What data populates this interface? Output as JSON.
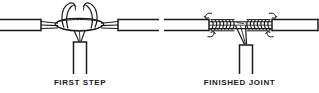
{
  "figure": {
    "background_color": "#ffffff",
    "line_color": "#1a1a1a",
    "width": 319,
    "height": 93
  },
  "panels": [
    {
      "id": "first-step",
      "caption": "FIRST STEP",
      "description": "Bare conductors of the run wire and tap wire crossed and looped before wrapping",
      "elements": {
        "run_wire_left_label": "run-wire-left",
        "run_wire_right_label": "run-wire-right",
        "tap_wire_label": "tap-wire-drop",
        "loop_label": "crossed-conductor-loop"
      }
    },
    {
      "id": "finished-joint",
      "caption": "FINISHED JOINT",
      "description": "Conductors wrapped into tight coils on both sides with rotation direction arrows",
      "elements": {
        "run_wire_left_label": "run-wire-left",
        "run_wire_right_label": "run-wire-right",
        "tap_wire_label": "tap-wire-drop",
        "coil_left_label": "wrapped-coil-left",
        "coil_right_label": "wrapped-coil-right",
        "arrow_left_label": "rotation-arrow-left",
        "arrow_right_label": "rotation-arrow-right"
      }
    }
  ]
}
